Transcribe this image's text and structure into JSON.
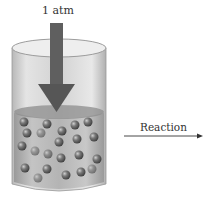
{
  "diagram": {
    "pressure_label": "1 atm",
    "reaction_label": "Reaction",
    "colors": {
      "cylinder_glass": "#d8d8d8",
      "liquid": "#a8a8a8",
      "arrow": "#5a5a5a",
      "sphere": "#6e6e6e"
    }
  }
}
